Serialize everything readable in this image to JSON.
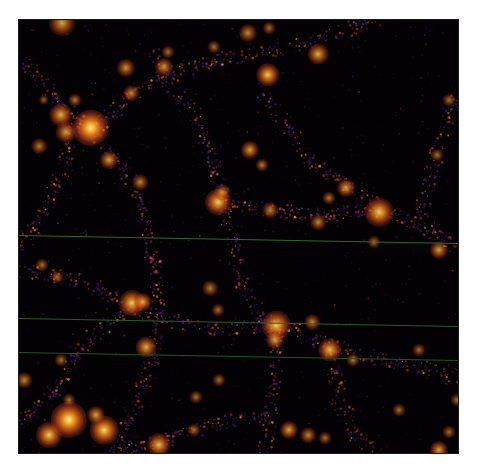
{
  "image": {
    "subject": "cosmic web dark matter density field",
    "frame": {
      "x": 19,
      "y": 20,
      "width": 439,
      "height": 433
    },
    "colormap": {
      "background": "#030104",
      "faint": "#4a1a6e",
      "mid": "#c0391b",
      "bright": "#ff8a1a",
      "core": "#ffe27a"
    }
  },
  "scanlines": [
    {
      "y_left": 215,
      "y_right": 223,
      "color": "#2f6a1c"
    },
    {
      "y_left": 298,
      "y_right": 306,
      "color": "#2a5f1a"
    },
    {
      "y_left": 332,
      "y_right": 340,
      "color": "#24551a"
    }
  ],
  "filaments": [
    [
      [
        0,
        40
      ],
      [
        60,
        100
      ],
      [
        75,
        110
      ],
      [
        110,
        160
      ],
      [
        125,
        200
      ],
      [
        135,
        240
      ],
      [
        140,
        300
      ],
      [
        130,
        350
      ],
      [
        110,
        400
      ],
      [
        90,
        433
      ]
    ],
    [
      [
        75,
        110
      ],
      [
        120,
        70
      ],
      [
        160,
        50
      ],
      [
        200,
        40
      ],
      [
        250,
        30
      ],
      [
        300,
        20
      ],
      [
        360,
        0
      ]
    ],
    [
      [
        130,
        30
      ],
      [
        150,
        60
      ],
      [
        175,
        95
      ],
      [
        195,
        140
      ],
      [
        205,
        185
      ],
      [
        215,
        230
      ],
      [
        225,
        270
      ],
      [
        245,
        300
      ],
      [
        260,
        330
      ]
    ],
    [
      [
        195,
        185
      ],
      [
        250,
        190
      ],
      [
        300,
        195
      ],
      [
        355,
        190
      ],
      [
        400,
        205
      ],
      [
        439,
        225
      ]
    ],
    [
      [
        240,
        70
      ],
      [
        270,
        110
      ],
      [
        300,
        150
      ],
      [
        340,
        170
      ],
      [
        360,
        190
      ]
    ],
    [
      [
        0,
        250
      ],
      [
        60,
        260
      ],
      [
        110,
        285
      ],
      [
        150,
        300
      ],
      [
        200,
        310
      ],
      [
        260,
        305
      ],
      [
        310,
        325
      ],
      [
        360,
        340
      ],
      [
        420,
        350
      ],
      [
        439,
        360
      ]
    ],
    [
      [
        260,
        305
      ],
      [
        255,
        360
      ],
      [
        250,
        400
      ],
      [
        245,
        433
      ]
    ],
    [
      [
        110,
        285
      ],
      [
        60,
        330
      ],
      [
        30,
        380
      ],
      [
        0,
        400
      ]
    ],
    [
      [
        310,
        325
      ],
      [
        320,
        380
      ],
      [
        340,
        420
      ],
      [
        360,
        433
      ]
    ],
    [
      [
        400,
        205
      ],
      [
        420,
        120
      ],
      [
        439,
        80
      ]
    ],
    [
      [
        60,
        100
      ],
      [
        40,
        160
      ],
      [
        20,
        200
      ],
      [
        0,
        230
      ]
    ],
    [
      [
        90,
        433
      ],
      [
        150,
        420
      ],
      [
        210,
        400
      ],
      [
        250,
        400
      ]
    ]
  ],
  "halos": [
    {
      "x": 72,
      "y": 108,
      "r": 14,
      "i": 1.0
    },
    {
      "x": 42,
      "y": 95,
      "r": 9,
      "i": 0.75
    },
    {
      "x": 47,
      "y": 112,
      "r": 8,
      "i": 0.7
    },
    {
      "x": 90,
      "y": 140,
      "r": 7,
      "i": 0.7
    },
    {
      "x": 43,
      "y": 3,
      "r": 10,
      "i": 0.7
    },
    {
      "x": 107,
      "y": 48,
      "r": 7,
      "i": 0.65
    },
    {
      "x": 145,
      "y": 47,
      "r": 7,
      "i": 0.65
    },
    {
      "x": 112,
      "y": 73,
      "r": 6,
      "i": 0.6
    },
    {
      "x": 56,
      "y": 80,
      "r": 5,
      "i": 0.55
    },
    {
      "x": 20,
      "y": 126,
      "r": 6,
      "i": 0.55
    },
    {
      "x": 121,
      "y": 162,
      "r": 6,
      "i": 0.6
    },
    {
      "x": 149,
      "y": 32,
      "r": 5,
      "i": 0.5
    },
    {
      "x": 199,
      "y": 182,
      "r": 10,
      "i": 0.85
    },
    {
      "x": 203,
      "y": 172,
      "r": 6,
      "i": 0.6
    },
    {
      "x": 231,
      "y": 130,
      "r": 7,
      "i": 0.7
    },
    {
      "x": 249,
      "y": 55,
      "r": 9,
      "i": 0.85
    },
    {
      "x": 229,
      "y": 13,
      "r": 7,
      "i": 0.6
    },
    {
      "x": 195,
      "y": 27,
      "r": 5,
      "i": 0.5
    },
    {
      "x": 299,
      "y": 34,
      "r": 8,
      "i": 0.75
    },
    {
      "x": 250,
      "y": 8,
      "r": 5,
      "i": 0.5
    },
    {
      "x": 360,
      "y": 192,
      "r": 11,
      "i": 0.85
    },
    {
      "x": 327,
      "y": 168,
      "r": 7,
      "i": 0.7
    },
    {
      "x": 251,
      "y": 190,
      "r": 6,
      "i": 0.6
    },
    {
      "x": 310,
      "y": 178,
      "r": 5,
      "i": 0.55
    },
    {
      "x": 420,
      "y": 230,
      "r": 7,
      "i": 0.7
    },
    {
      "x": 299,
      "y": 202,
      "r": 6,
      "i": 0.6
    },
    {
      "x": 243,
      "y": 145,
      "r": 5,
      "i": 0.55
    },
    {
      "x": 430,
      "y": 80,
      "r": 5,
      "i": 0.5
    },
    {
      "x": 418,
      "y": 135,
      "r": 5,
      "i": 0.5
    },
    {
      "x": 355,
      "y": 222,
      "r": 5,
      "i": 0.5
    },
    {
      "x": 113,
      "y": 283,
      "r": 10,
      "i": 0.85
    },
    {
      "x": 124,
      "y": 282,
      "r": 7,
      "i": 0.7
    },
    {
      "x": 127,
      "y": 327,
      "r": 8,
      "i": 0.75
    },
    {
      "x": 25,
      "y": 80,
      "r": 4,
      "i": 0.45
    },
    {
      "x": 23,
      "y": 245,
      "r": 5,
      "i": 0.5
    },
    {
      "x": 38,
      "y": 257,
      "r": 5,
      "i": 0.5
    },
    {
      "x": 191,
      "y": 268,
      "r": 6,
      "i": 0.55
    },
    {
      "x": 199,
      "y": 290,
      "r": 5,
      "i": 0.5
    },
    {
      "x": 257,
      "y": 305,
      "r": 11,
      "i": 0.85
    },
    {
      "x": 256,
      "y": 320,
      "r": 7,
      "i": 0.7
    },
    {
      "x": 293,
      "y": 302,
      "r": 6,
      "i": 0.6
    },
    {
      "x": 311,
      "y": 330,
      "r": 9,
      "i": 0.8
    },
    {
      "x": 334,
      "y": 340,
      "r": 5,
      "i": 0.55
    },
    {
      "x": 200,
      "y": 360,
      "r": 5,
      "i": 0.5
    },
    {
      "x": 177,
      "y": 377,
      "r": 5,
      "i": 0.5
    },
    {
      "x": 50,
      "y": 400,
      "r": 14,
      "i": 1.0
    },
    {
      "x": 30,
      "y": 415,
      "r": 10,
      "i": 0.85
    },
    {
      "x": 85,
      "y": 410,
      "r": 11,
      "i": 0.9
    },
    {
      "x": 77,
      "y": 395,
      "r": 7,
      "i": 0.7
    },
    {
      "x": 140,
      "y": 425,
      "r": 9,
      "i": 0.8
    },
    {
      "x": 5,
      "y": 360,
      "r": 6,
      "i": 0.6
    },
    {
      "x": 42,
      "y": 340,
      "r": 5,
      "i": 0.5
    },
    {
      "x": 50,
      "y": 380,
      "r": 5,
      "i": 0.5
    },
    {
      "x": 270,
      "y": 410,
      "r": 7,
      "i": 0.7
    },
    {
      "x": 289,
      "y": 415,
      "r": 6,
      "i": 0.6
    },
    {
      "x": 306,
      "y": 418,
      "r": 5,
      "i": 0.5
    },
    {
      "x": 420,
      "y": 430,
      "r": 7,
      "i": 0.7
    },
    {
      "x": 430,
      "y": 412,
      "r": 5,
      "i": 0.5
    },
    {
      "x": 380,
      "y": 390,
      "r": 5,
      "i": 0.5
    },
    {
      "x": 400,
      "y": 330,
      "r": 5,
      "i": 0.5
    },
    {
      "x": 438,
      "y": 380,
      "r": 5,
      "i": 0.5
    },
    {
      "x": 175,
      "y": 410,
      "r": 5,
      "i": 0.5
    }
  ]
}
